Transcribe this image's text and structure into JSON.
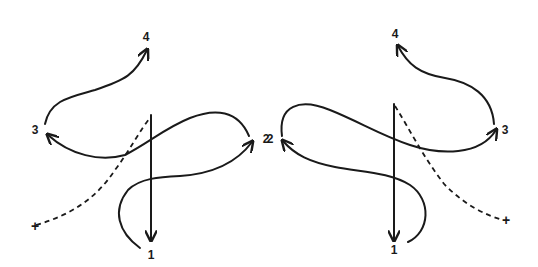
{
  "figure": {
    "left_panel": {
      "labels": {
        "p1": "1",
        "p2": "2",
        "p3": "3",
        "p4": "4",
        "start": "+"
      }
    },
    "right_panel": {
      "labels": {
        "p1": "1",
        "p2": "2",
        "p3": "3",
        "p4": "4",
        "start": "+"
      }
    },
    "colors": {
      "stroke": "#1a1a1a",
      "background": "#ffffff"
    }
  }
}
